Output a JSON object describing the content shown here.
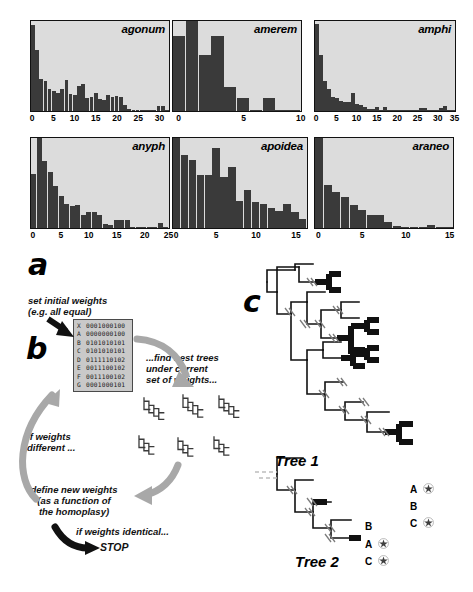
{
  "figure": {
    "panels": [
      {
        "id": "a",
        "label": "a"
      },
      {
        "id": "b",
        "label": "b"
      },
      {
        "id": "c",
        "label": "c"
      }
    ]
  },
  "chart_data": [
    {
      "type": "bar",
      "title": "agonum",
      "xlabel": "",
      "ylabel": "",
      "xlim": [
        0,
        33
      ],
      "ylim": [
        0,
        100
      ],
      "grid": false,
      "legend": null,
      "ticks": [
        0,
        5,
        10,
        15,
        20,
        25,
        30
      ],
      "categories": [
        0,
        1,
        2,
        3,
        4,
        5,
        6,
        7,
        8,
        9,
        10,
        11,
        12,
        13,
        14,
        15,
        16,
        17,
        18,
        19,
        20,
        21,
        22,
        23,
        24,
        25,
        26,
        27,
        28,
        29,
        30,
        31,
        32
      ],
      "values": [
        96,
        68,
        36,
        33,
        24,
        22,
        20,
        25,
        35,
        19,
        18,
        28,
        30,
        14,
        16,
        20,
        13,
        12,
        18,
        16,
        17,
        16,
        7,
        2,
        1,
        1,
        1,
        1,
        1,
        1,
        6,
        6,
        1
      ]
    },
    {
      "type": "bar",
      "title": "amerem",
      "xlabel": "",
      "ylabel": "",
      "xlim": [
        0,
        10
      ],
      "ylim": [
        0,
        100
      ],
      "grid": false,
      "legend": null,
      "ticks": [
        0,
        5,
        10
      ],
      "categories": [
        0,
        1,
        2,
        3,
        4,
        5,
        6,
        7,
        8,
        9
      ],
      "values": [
        83,
        100,
        62,
        83,
        27,
        15,
        1,
        15,
        1,
        1
      ]
    },
    {
      "type": "bar",
      "title": "amphi",
      "xlabel": "",
      "ylabel": "",
      "xlim": [
        0,
        35
      ],
      "ylim": [
        0,
        100
      ],
      "grid": false,
      "legend": null,
      "ticks": [
        0,
        5,
        10,
        15,
        20,
        25,
        30,
        35
      ],
      "categories": [
        0,
        1,
        2,
        3,
        4,
        5,
        6,
        7,
        8,
        9,
        10,
        11,
        12,
        13,
        14,
        15,
        16,
        17,
        18,
        19,
        20,
        21,
        22,
        23,
        24,
        25,
        26,
        27,
        28,
        29,
        30,
        31,
        32,
        33,
        34
      ],
      "values": [
        97,
        62,
        33,
        24,
        16,
        15,
        11,
        10,
        10,
        20,
        8,
        7,
        5,
        2,
        2,
        5,
        1,
        4,
        1,
        1,
        1,
        1,
        1,
        1,
        1,
        1,
        3,
        3,
        1,
        1,
        1,
        3,
        6,
        1,
        1
      ]
    },
    {
      "type": "bar",
      "title": "anyph",
      "xlabel": "",
      "ylabel": "",
      "xlim": [
        0,
        25
      ],
      "ylim": [
        0,
        100
      ],
      "grid": false,
      "legend": null,
      "ticks": [
        0,
        5,
        10,
        15,
        20,
        25
      ],
      "categories": [
        0,
        1,
        2,
        3,
        4,
        5,
        6,
        7,
        8,
        9,
        10,
        11,
        12,
        13,
        14,
        15,
        16,
        17,
        18,
        19,
        20,
        21,
        22,
        23,
        24
      ],
      "values": [
        60,
        100,
        74,
        62,
        47,
        36,
        27,
        24,
        26,
        14,
        18,
        18,
        14,
        5,
        3,
        9,
        9,
        9,
        1,
        1,
        1,
        1,
        1,
        6,
        1
      ]
    },
    {
      "type": "bar",
      "title": "apoidea",
      "xlabel": "",
      "ylabel": "",
      "xlim": [
        0,
        17
      ],
      "ylim": [
        0,
        100
      ],
      "grid": false,
      "legend": null,
      "ticks": [
        0,
        5,
        10,
        15
      ],
      "categories": [
        0,
        1,
        2,
        3,
        4,
        5,
        6,
        7,
        8,
        9,
        10,
        11,
        12,
        13,
        14,
        15,
        16
      ],
      "values": [
        100,
        81,
        76,
        59,
        59,
        89,
        57,
        68,
        30,
        42,
        29,
        27,
        22,
        19,
        27,
        18,
        10
      ]
    },
    {
      "type": "bar",
      "title": "araneo",
      "xlabel": "",
      "ylabel": "",
      "xlim": [
        0,
        16
      ],
      "ylim": [
        0,
        100
      ],
      "grid": false,
      "legend": null,
      "ticks": [
        0,
        5,
        10,
        15
      ],
      "categories": [
        0,
        1,
        2,
        3,
        4,
        5,
        6,
        7,
        8,
        9,
        10,
        11,
        12,
        13,
        14,
        15
      ],
      "values": [
        100,
        48,
        40,
        34,
        26,
        20,
        14,
        14,
        7,
        2,
        1,
        1,
        1,
        3,
        1,
        1
      ]
    }
  ],
  "panel_b": {
    "step_initial": "set initial weights\n(e.g. all equal)",
    "step_find": "...find best trees\nunder current\nset of weights...",
    "step_if_different": "if weights\ndifferent ...",
    "step_define": "define new weights\n(as a function of\nthe homoplasy)",
    "step_identical": "if weights identical...",
    "step_stop": "STOP",
    "matrix": {
      "rows": [
        {
          "taxon": "X",
          "states": "0001000100"
        },
        {
          "taxon": "A",
          "states": "0000000100"
        },
        {
          "taxon": "B",
          "states": "0101010101"
        },
        {
          "taxon": "C",
          "states": "0101010101"
        },
        {
          "taxon": "D",
          "states": "0111110102"
        },
        {
          "taxon": "E",
          "states": "0011100102"
        },
        {
          "taxon": "F",
          "states": "0011100102"
        },
        {
          "taxon": "G",
          "states": "0001000101"
        }
      ]
    }
  },
  "panel_c": {
    "tree1": {
      "label": "Tree 1",
      "taxa": [
        {
          "name": "A",
          "marked": true
        },
        {
          "name": "B",
          "marked": false
        },
        {
          "name": "C",
          "marked": true
        }
      ]
    },
    "tree2": {
      "label": "Tree 2",
      "taxa": [
        {
          "name": "B",
          "marked": false
        },
        {
          "name": "A",
          "marked": true
        },
        {
          "name": "C",
          "marked": true
        }
      ]
    }
  },
  "colors": {
    "plot_bg": "#dcdcdc",
    "bar": "#3a3a3a",
    "arrow_gray": "#a8a8a8",
    "arrow_black": "#111111",
    "matrix_bg": "#c9c9c9",
    "branch_black": "#111111",
    "branch_gray": "#bdbdbd"
  }
}
